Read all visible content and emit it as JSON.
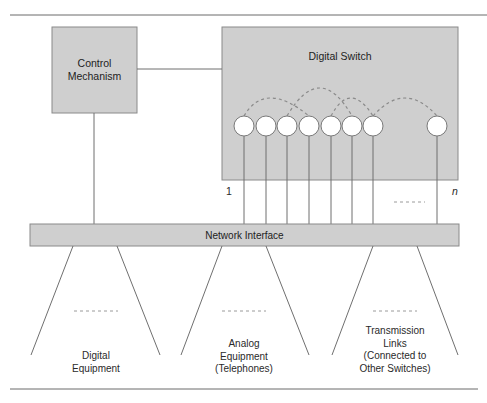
{
  "diagram": {
    "colors": {
      "box_fill": "#cfcfcf",
      "box_stroke": "#8a8a8a",
      "line": "#6f6f6f",
      "node_fill": "#ffffff",
      "node_stroke": "#7a7a7a",
      "dash": "#8a8a8a",
      "rule": "#6a6a6a"
    },
    "control": {
      "label_line1": "Control",
      "label_line2": "Mechanism"
    },
    "switch": {
      "label": "Digital Switch",
      "port_first_label": "1",
      "port_last_label": "n",
      "nodes": 8
    },
    "network_interface": {
      "label": "Network Interface"
    },
    "groups": [
      {
        "id": "digital",
        "lines": [
          "Digital",
          "Equipment"
        ]
      },
      {
        "id": "analog",
        "lines": [
          "Analog",
          "Equipment",
          "(Telephones)"
        ]
      },
      {
        "id": "transmission",
        "lines": [
          "Transmission",
          "Links",
          "(Connected to",
          "Other Switches)"
        ]
      }
    ]
  }
}
